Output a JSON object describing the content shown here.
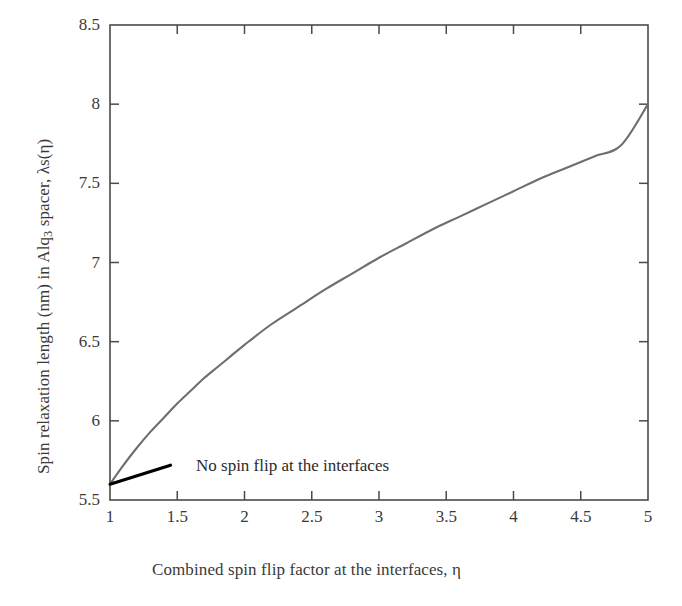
{
  "chart_data": {
    "type": "line",
    "title": "",
    "xlabel": "Combined spin flip factor at the interfaces, η",
    "ylabel_parts": {
      "before": "Spin relaxation length (nm) in Alq",
      "sub": "3",
      "after": " spacer, λs(η)"
    },
    "ylabel": "Spin relaxation length (nm) in Alq3 spacer, λs(η)",
    "xlim": [
      1,
      5
    ],
    "ylim": [
      5.5,
      8.5
    ],
    "grid": false,
    "legend": "none",
    "series": [
      {
        "name": "λs(η)",
        "color": "#6e6e6e",
        "x": [
          1.0,
          1.1,
          1.2,
          1.3,
          1.4,
          1.5,
          1.6,
          1.7,
          1.8,
          1.9,
          2.0,
          2.2,
          2.4,
          2.6,
          2.8,
          3.0,
          3.2,
          3.4,
          3.6,
          3.8,
          4.0,
          4.2,
          4.4,
          4.6,
          4.8,
          5.0
        ],
        "values": [
          5.6,
          5.72,
          5.83,
          5.93,
          6.02,
          6.11,
          6.19,
          6.27,
          6.34,
          6.41,
          6.48,
          6.61,
          6.72,
          6.83,
          6.93,
          7.03,
          7.12,
          7.21,
          7.29,
          7.37,
          7.45,
          7.53,
          7.6,
          7.67,
          7.74,
          8.0
        ]
      }
    ],
    "annotations": [
      {
        "text": "No spin flip at the interfaces",
        "pointer_from": [
          1.0,
          5.6
        ],
        "pointer_to": [
          1.45,
          5.72
        ],
        "color": "#000000"
      }
    ],
    "xticks": [
      {
        "value": 1,
        "label": "1"
      },
      {
        "value": 1.5,
        "label": "1.5"
      },
      {
        "value": 2,
        "label": "2"
      },
      {
        "value": 2.5,
        "label": "2.5"
      },
      {
        "value": 3,
        "label": "3"
      },
      {
        "value": 3.5,
        "label": "3.5"
      },
      {
        "value": 4,
        "label": "4"
      },
      {
        "value": 4.5,
        "label": "4.5"
      },
      {
        "value": 5,
        "label": "5"
      }
    ],
    "yticks": [
      {
        "value": 5.5,
        "label": "5.5"
      },
      {
        "value": 6,
        "label": "6"
      },
      {
        "value": 6.5,
        "label": "6.5"
      },
      {
        "value": 7,
        "label": "7"
      },
      {
        "value": 7.5,
        "label": "7.5"
      },
      {
        "value": 8,
        "label": "8"
      },
      {
        "value": 8.5,
        "label": "8.5"
      }
    ],
    "axis_color": "#4a4a4a",
    "background": "#ffffff"
  }
}
